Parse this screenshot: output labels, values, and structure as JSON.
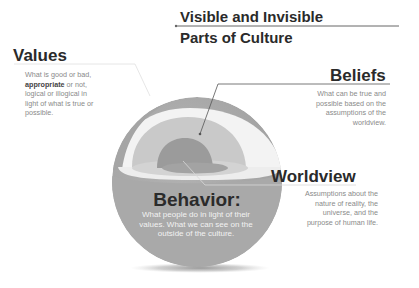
{
  "title": {
    "line1": "Visible and Invisible",
    "line2": "Parts of Culture"
  },
  "values": {
    "heading": "Values",
    "desc_before": "What is good or bad, ",
    "desc_bold": "appropriate",
    "desc_after": " or not, logical or illogical in light of what is true or possible."
  },
  "beliefs": {
    "heading": "Beliefs",
    "desc": "What can be true and possible based on the assumptions of the worldview."
  },
  "worldview": {
    "heading": "Worldview",
    "desc": "Assumptions about the nature of reality, the universe, and the purpose of human life."
  },
  "behavior": {
    "heading": "Behavior:",
    "desc": "What people do in light of their values. What we can see on the outside of the culture."
  },
  "colors": {
    "outer_shell": "#a9a9a9",
    "values_layer": "#f2f2f2",
    "beliefs_layer": "#c9c9c9",
    "worldview_core": "#9d9d9d",
    "text_dark": "#2a2a2a",
    "text_muted": "#8a8a8a"
  }
}
